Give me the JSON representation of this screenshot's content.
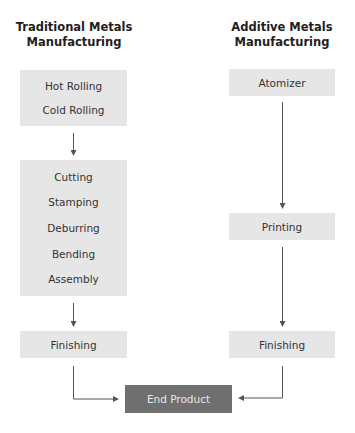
{
  "columns": {
    "traditional": {
      "title_line1": "Traditional Metals",
      "title_line2": "Manufacturing",
      "group1": [
        "Hot Rolling",
        "Cold Rolling"
      ],
      "group2": [
        "Cutting",
        "Stamping",
        "Deburring",
        "Bending",
        "Assembly"
      ],
      "finishing": "Finishing"
    },
    "additive": {
      "title_line1": "Additive Metals",
      "title_line2": "Manufacturing",
      "step1": "Atomizer",
      "step2": "Printing",
      "finishing": "Finishing"
    }
  },
  "end_product": "End Product",
  "colors": {
    "box": "#e6e6e6",
    "end_box": "#6f6f6f",
    "arrow": "#555555"
  }
}
